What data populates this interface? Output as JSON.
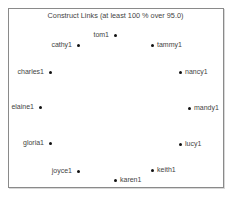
{
  "title": "Construct Links (at least 100 % over 95.0)",
  "nodes": [
    {
      "label": "tom1",
      "x": 115,
      "y": 35,
      "side": "left"
    },
    {
      "label": "cathy1",
      "x": 78,
      "y": 45,
      "side": "left"
    },
    {
      "label": "tammy1",
      "x": 152,
      "y": 45,
      "side": "right"
    },
    {
      "label": "charles1",
      "x": 50,
      "y": 72,
      "side": "left"
    },
    {
      "label": "nancy1",
      "x": 180,
      "y": 72,
      "side": "right"
    },
    {
      "label": "elaine1",
      "x": 40,
      "y": 107,
      "side": "left"
    },
    {
      "label": "mandy1",
      "x": 189,
      "y": 108,
      "side": "right"
    },
    {
      "label": "gloria1",
      "x": 50,
      "y": 143,
      "side": "left"
    },
    {
      "label": "lucy1",
      "x": 180,
      "y": 144,
      "side": "right"
    },
    {
      "label": "joyce1",
      "x": 78,
      "y": 171,
      "side": "left"
    },
    {
      "label": "keith1",
      "x": 152,
      "y": 170,
      "side": "right"
    },
    {
      "label": "karen1",
      "x": 115,
      "y": 180,
      "side": "right"
    }
  ],
  "colors": {
    "dot": "#111111",
    "text": "#444444",
    "border": "#8a8a8a"
  }
}
